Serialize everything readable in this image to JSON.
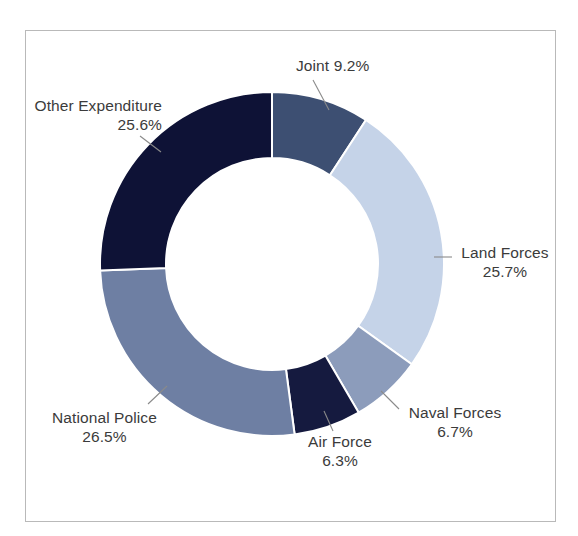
{
  "chart_data": {
    "type": "pie",
    "variant": "donut",
    "title": "",
    "subtitle": "",
    "xlabel": "",
    "ylabel": "",
    "legend_position": "none",
    "labels_position": "outside-with-leader-lines",
    "grid": false,
    "start_angle_deg": 0,
    "direction": "clockwise",
    "units": "percent",
    "categories": [
      "Joint",
      "Land Forces",
      "Naval Forces",
      "Air Force",
      "National Police",
      "Other Expenditure"
    ],
    "values": [
      9.2,
      25.7,
      6.7,
      6.3,
      26.5,
      25.6
    ],
    "value_labels": [
      "9.2%",
      "25.7%",
      "6.7%",
      "6.3%",
      "26.5%",
      "25.6%"
    ],
    "colors": [
      "#3d4f72",
      "#c5d3e8",
      "#8c9cbb",
      "#151a3f",
      "#6e7fa3",
      "#0e1236"
    ],
    "slices": [
      {
        "name": "Joint",
        "value": 9.2,
        "value_label": "9.2%",
        "color": "#3d4f72"
      },
      {
        "name": "Land Forces",
        "value": 25.7,
        "value_label": "25.7%",
        "color": "#c5d3e8"
      },
      {
        "name": "Naval Forces",
        "value": 6.7,
        "value_label": "6.7%",
        "color": "#8c9cbb"
      },
      {
        "name": "Air Force",
        "value": 6.3,
        "value_label": "6.3%",
        "color": "#151a3f"
      },
      {
        "name": "National Police",
        "value": 26.5,
        "value_label": "26.5%",
        "color": "#6e7fa3"
      },
      {
        "name": "Other Expenditure",
        "value": 25.6,
        "value_label": "25.6%",
        "color": "#0e1236"
      }
    ]
  },
  "labels": {
    "joint": {
      "name": "Joint",
      "value": "9.2%",
      "combined": "Joint 9.2%"
    },
    "land_forces": {
      "name": "Land Forces",
      "value": "25.7%"
    },
    "naval_forces": {
      "name": "Naval Forces",
      "value": "6.7%"
    },
    "air_force": {
      "name": "Air Force",
      "value": "6.3%"
    },
    "national_police": {
      "name": "National Police",
      "value": "26.5%"
    },
    "other_expenditure": {
      "name": "Other Expenditure",
      "value": "25.6%"
    }
  },
  "style": {
    "text_color": "#3b3b3b",
    "frame_border_color": "#b9b9b9",
    "background": "#ffffff",
    "leader_line_color": "#8a8a8a",
    "slice_gap_color": "#ffffff"
  }
}
